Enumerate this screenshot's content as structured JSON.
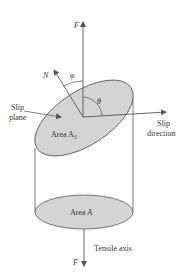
{
  "figure": {
    "type": "schematic"
  },
  "labels": {
    "force_top": "F",
    "force_bottom": "F",
    "normal": "N",
    "phi": "φ",
    "theta": "θ",
    "slip_plane_line1": "Slip",
    "slip_plane_line2": "plane",
    "slip_direction_line1": "Slip",
    "slip_direction_line2": "direction",
    "area_slip_prefix": "Area A",
    "area_slip_subscript": "S",
    "area_cross_section": "Area A",
    "tensile_axis": "Tensile axis"
  },
  "colors": {
    "line": "#555555",
    "ellipse_fill": "#d4d4d4",
    "text": "#333333",
    "background": "#ffffff"
  }
}
